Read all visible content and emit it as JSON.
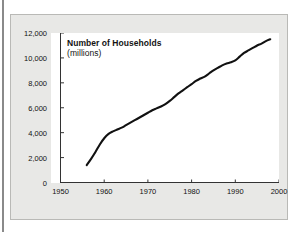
{
  "chart_data": {
    "type": "line",
    "title": "Number of Households",
    "subtitle": "(millions)",
    "xlabel": "",
    "ylabel": "",
    "xlim": [
      1950,
      2000
    ],
    "ylim": [
      0,
      12000
    ],
    "xticks": [
      "1950",
      "1960",
      "1970",
      "1980",
      "1990",
      "2000"
    ],
    "xtick_values": [
      1950,
      1960,
      1970,
      1980,
      1990,
      2000
    ],
    "yticks": [
      "0",
      "2,000",
      "4,000",
      "6,000",
      "8,000",
      "10,000",
      "12,000"
    ],
    "ytick_values": [
      0,
      2000,
      4000,
      6000,
      8000,
      10000,
      12000
    ],
    "grid": false,
    "legend": false,
    "line_color": "#111111",
    "series": [
      {
        "name": "Number of Households (millions)",
        "x": [
          1956,
          1957,
          1958,
          1959,
          1960,
          1961,
          1962,
          1963,
          1964,
          1965,
          1966,
          1967,
          1968,
          1969,
          1970,
          1971,
          1972,
          1973,
          1974,
          1975,
          1976,
          1977,
          1978,
          1979,
          1980,
          1981,
          1982,
          1983,
          1984,
          1985,
          1986,
          1987,
          1988,
          1989,
          1990,
          1991,
          1992,
          1993,
          1994,
          1995,
          1996,
          1997,
          1998
        ],
        "values": [
          1400,
          1900,
          2450,
          3050,
          3550,
          3900,
          4100,
          4250,
          4400,
          4600,
          4800,
          5000,
          5200,
          5400,
          5600,
          5800,
          5950,
          6100,
          6300,
          6550,
          6850,
          7150,
          7400,
          7650,
          7900,
          8150,
          8350,
          8500,
          8750,
          9000,
          9200,
          9400,
          9550,
          9650,
          9800,
          10100,
          10400,
          10600,
          10800,
          11000,
          11150,
          11350,
          11500
        ]
      }
    ]
  },
  "figure": {
    "panel_background": "#e8e8e6",
    "plot_background": "#ffffff",
    "border_color": "#b9b9b6"
  }
}
